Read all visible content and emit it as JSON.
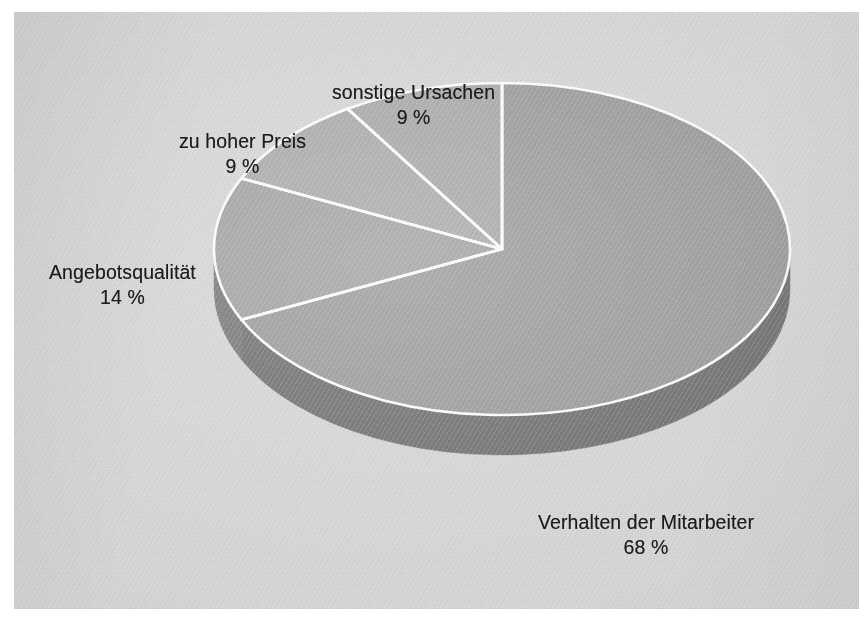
{
  "figure": {
    "kind": "pie-chart-3d",
    "background_color": "#d7d8d6",
    "page_color": "#ffffff",
    "separator_color": "#ffffff",
    "text_color": "#1d1d1d"
  },
  "chart_data": {
    "type": "pie",
    "title": "",
    "subtitle": "",
    "xlabel": "",
    "ylabel": "",
    "legend_position": "none",
    "grid": false,
    "three_d": true,
    "start_angle_deg": 0,
    "direction": "clockwise",
    "value_unit": "%",
    "categories": [
      "Verhalten der Mitarbeiter",
      "Angebotsqualität",
      "zu hoher Preis",
      "sonstige Ursachen"
    ],
    "values": [
      68,
      14,
      9,
      9
    ],
    "value_labels": [
      "68 %",
      "14 %",
      "9 %",
      "9 %"
    ],
    "colors": [
      "#9a9a9a",
      "#a1a1a1",
      "#a9a9a9",
      "#a7a7a7"
    ],
    "side_colors": [
      "#6e6e6e",
      "#767676",
      "#7d7d7d",
      "#7b7b7b"
    ],
    "slices": [
      {
        "label": "Verhalten der Mitarbeiter",
        "value": 68,
        "value_label": "68 %",
        "color": "#9a9a9a"
      },
      {
        "label": "Angebotsqualität",
        "value": 14,
        "value_label": "14 %",
        "color": "#a1a1a1"
      },
      {
        "label": "zu hoher Preis",
        "value": 9,
        "value_label": "9 %",
        "color": "#a9a9a9"
      },
      {
        "label": "sonstige Ursachen",
        "value": 9,
        "value_label": "9 %",
        "color": "#a7a7a7"
      }
    ]
  },
  "labels": {
    "sonstige": {
      "name": "sonstige Ursachen",
      "percent": "9 %"
    },
    "preis": {
      "name": "zu hoher Preis",
      "percent": "9 %"
    },
    "angebots": {
      "name": "Angebotsqualität",
      "percent": "14 %"
    },
    "verhalten": {
      "name": "Verhalten der Mitarbeiter",
      "percent": "68 %"
    }
  }
}
